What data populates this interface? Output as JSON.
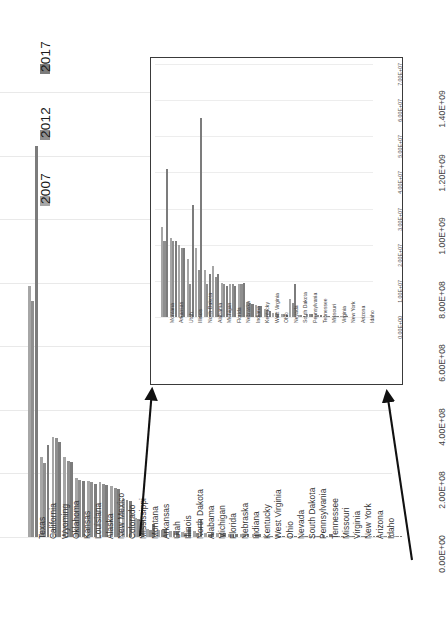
{
  "legend": {
    "items": [
      {
        "label": "2017",
        "color": "#7c7c7c"
      },
      {
        "label": "2012",
        "color": "#8f8f8f"
      },
      {
        "label": "2007",
        "color": "#a6a6a6"
      }
    ]
  },
  "chart_data": {
    "type": "bar",
    "title": "",
    "xlabel": "",
    "ylabel": "",
    "grid": true,
    "legend_position": "top-left-rotated",
    "ylim": [
      0,
      1400000000
    ],
    "yticks": [
      "0.00E+00",
      "2.00E+08",
      "4.00E+08",
      "6.00E+08",
      "8.00E+08",
      "1.00E+09",
      "1.20E+09",
      "1.40E+09"
    ],
    "ytick_values": [
      0,
      200000000,
      400000000,
      600000000,
      800000000,
      1000000000,
      1200000000,
      1400000000
    ],
    "categories": [
      "Texas",
      "California",
      "Wyoming",
      "Oklahoma",
      "Kansas",
      "Louisiana",
      "Alaska",
      "New Mexico",
      "Colorado",
      "Mississippi",
      "Montana",
      "Arkansas",
      "Utah",
      "Illinois",
      "North Dakota",
      "Alabama",
      "Michigan",
      "Florida",
      "Nebraska",
      "Indiana",
      "Kentucky",
      "West Virginia",
      "Ohio",
      "Nevada",
      "South Dakota",
      "Pennsylvania",
      "Tennessee",
      "Missouri",
      "Virginia",
      "New York",
      "Arizona",
      "Idaho"
    ],
    "series": [
      {
        "name": "2007",
        "color": "#a6a6a6",
        "values": [
          790000000,
          252000000,
          316000000,
          252000000,
          186000000,
          176000000,
          172000000,
          160000000,
          120000000,
          60000000,
          25000000,
          22000000,
          20000000,
          16000000,
          19000000,
          13000000,
          14000000,
          9500000,
          9000000,
          9200000,
          4200000,
          3200000,
          2300000,
          1200000,
          800000,
          5000000,
          600000,
          900000,
          700000,
          400000,
          300000,
          200000
        ]
      },
      {
        "name": "2012",
        "color": "#8f8f8f",
        "values": [
          742000000,
          232000000,
          312000000,
          240000000,
          180000000,
          172000000,
          168000000,
          155000000,
          116000000,
          57000000,
          21000000,
          21000000,
          19000000,
          9000000,
          13000000,
          9000000,
          11000000,
          9000000,
          9000000,
          9000000,
          4000000,
          3000000,
          2000000,
          1000000,
          700000,
          4000000,
          500000,
          800000,
          600000,
          350000,
          250000,
          180000
        ]
      },
      {
        "name": "2017",
        "color": "#7c7c7c",
        "values": [
          1230000000,
          290000000,
          300000000,
          236000000,
          176000000,
          168000000,
          164000000,
          152000000,
          112000000,
          54000000,
          41000000,
          21000000,
          19000000,
          31000000,
          55000000,
          12000000,
          12000000,
          8500000,
          8500000,
          9500000,
          3600000,
          3000000,
          1800000,
          900000,
          600000,
          9000000,
          400000,
          700000,
          500000,
          300000,
          200000,
          150000
        ]
      }
    ]
  },
  "inset": {
    "type": "bar",
    "ylim": [
      0,
      70000000
    ],
    "yticks": [
      "0.00E+00",
      "1.00E+07",
      "2.00E+07",
      "3.00E+07",
      "4.00E+07",
      "5.00E+07",
      "6.00E+07",
      "7.00E+07"
    ],
    "ytick_values": [
      0,
      10000000,
      20000000,
      30000000,
      40000000,
      50000000,
      60000000,
      70000000
    ],
    "categories": [
      "Montana",
      "Arkansas",
      "Utah",
      "Illinois",
      "North Dakota",
      "Alabama",
      "Michigan",
      "Florida",
      "Nebraska",
      "Indiana",
      "Kentucky",
      "West Virginia",
      "Ohio",
      "Nevada",
      "South Dakota",
      "Pennsylvania",
      "Tennessee",
      "Missouri",
      "Virginia",
      "New York",
      "Arizona",
      "Idaho"
    ],
    "series": [
      {
        "name": "2007",
        "color": "#a6a6a6",
        "values": [
          25000000,
          22000000,
          20000000,
          16000000,
          19000000,
          13000000,
          14000000,
          9500000,
          9000000,
          9200000,
          4200000,
          3200000,
          2300000,
          1200000,
          800000,
          5000000,
          600000,
          900000,
          700000,
          400000,
          300000,
          200000
        ]
      },
      {
        "name": "2012",
        "color": "#8f8f8f",
        "values": [
          21000000,
          21000000,
          19000000,
          9000000,
          13000000,
          9000000,
          11000000,
          9000000,
          9000000,
          9000000,
          4000000,
          3000000,
          2000000,
          1000000,
          700000,
          4000000,
          500000,
          800000,
          600000,
          350000,
          250000,
          180000
        ]
      },
      {
        "name": "2017",
        "color": "#7c7c7c",
        "values": [
          41000000,
          21000000,
          19000000,
          31000000,
          55000000,
          12000000,
          12000000,
          8500000,
          8500000,
          9500000,
          3600000,
          3000000,
          1800000,
          900000,
          600000,
          9000000,
          400000,
          700000,
          500000,
          300000,
          200000,
          150000
        ]
      }
    ]
  }
}
